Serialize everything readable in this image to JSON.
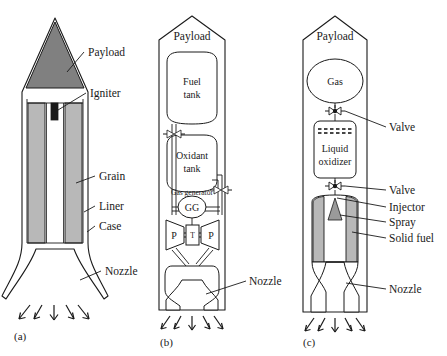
{
  "figure": {
    "background": "#ffffff",
    "width": 447,
    "height": 356
  },
  "colors": {
    "payload_fill": "#808080",
    "grain_fill": "#b8b8b8",
    "solid_fuel_fill": "#b8b8b8",
    "spray_fill": "#9a9a9a",
    "igniter_fill": "#1a1a1a",
    "stroke": "#1a1a1a",
    "white": "#ffffff"
  },
  "panels": [
    {
      "id": "a",
      "caption": "(a)",
      "type": "solid-propellant-rocket",
      "labels": [
        {
          "key": "payload",
          "text": "Payload"
        },
        {
          "key": "igniter",
          "text": "Igniter"
        },
        {
          "key": "grain",
          "text": "Grain"
        },
        {
          "key": "liner",
          "text": "Liner"
        },
        {
          "key": "case",
          "text": "Case"
        },
        {
          "key": "nozzle",
          "text": "Nozzle"
        }
      ]
    },
    {
      "id": "b",
      "caption": "(b)",
      "type": "liquid-propellant-rocket",
      "labels": [
        {
          "key": "payload",
          "text": "Payload"
        },
        {
          "key": "fuel_tank",
          "text": "Fuel\ntank"
        },
        {
          "key": "oxidant_tank",
          "text": "Oxidant\ntank"
        },
        {
          "key": "gas_generator",
          "text": "Gas generator"
        },
        {
          "key": "nozzle",
          "text": "Nozzle"
        }
      ],
      "components": {
        "fuel_tank_line1": "Fuel",
        "fuel_tank_line2": "tank",
        "oxidant_tank_line1": "Oxidant",
        "oxidant_tank_line2": "tank",
        "gas_generator_label": "Gas generator",
        "gas_generator_symbol": "GG",
        "pump_left_symbol": "P",
        "pump_right_symbol": "P",
        "turbine_symbol": "T"
      }
    },
    {
      "id": "c",
      "caption": "(c)",
      "type": "hybrid-rocket",
      "labels": [
        {
          "key": "payload",
          "text": "Payload"
        },
        {
          "key": "gas",
          "text": "Gas"
        },
        {
          "key": "valve_upper",
          "text": "Valve"
        },
        {
          "key": "liquid_oxidizer",
          "text": "Liquid\noxidizer"
        },
        {
          "key": "valve_lower",
          "text": "Valve"
        },
        {
          "key": "injector",
          "text": "Injector"
        },
        {
          "key": "spray",
          "text": "Spray"
        },
        {
          "key": "solid_fuel",
          "text": "Solid fuel"
        },
        {
          "key": "nozzle",
          "text": "Nozzle"
        }
      ],
      "components": {
        "gas_tank_label": "Gas",
        "oxidizer_line1": "Liquid",
        "oxidizer_line2": "oxidizer"
      }
    }
  ],
  "text": {
    "payload": "Payload",
    "igniter": "Igniter",
    "grain": "Grain",
    "liner": "Liner",
    "case": "Case",
    "nozzle": "Nozzle",
    "fuel": "Fuel",
    "tank": "tank",
    "oxidant": "Oxidant",
    "gas_generator": "Gas generator",
    "gg": "GG",
    "p": "P",
    "t": "T",
    "gas": "Gas",
    "valve": "Valve",
    "liquid": "Liquid",
    "oxidizer": "oxidizer",
    "injector": "Injector",
    "spray": "Spray",
    "solid_fuel": "Solid fuel",
    "caption_a": "(a)",
    "caption_b": "(b)",
    "caption_c": "(c)"
  }
}
